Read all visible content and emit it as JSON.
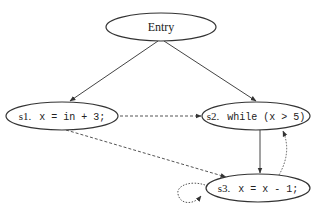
{
  "diagram": {
    "type": "control-flow / dependence graph",
    "nodes": [
      {
        "id": "entry",
        "label": "Entry",
        "cx": 161,
        "cy": 27,
        "rx": 55,
        "ry": 14
      },
      {
        "id": "s1",
        "prefix": "s1.",
        "code": "x = in + 3;",
        "cx": 62,
        "cy": 116,
        "rx": 56,
        "ry": 14
      },
      {
        "id": "s2",
        "prefix": "s2.",
        "code": "while (x > 5)",
        "cx": 256,
        "cy": 116,
        "rx": 54,
        "ry": 14
      },
      {
        "id": "s3",
        "prefix": "s3.",
        "code": "x = x - 1;",
        "cx": 258,
        "cy": 188,
        "rx": 52,
        "ry": 14
      }
    ],
    "edges": [
      {
        "from": "entry",
        "to": "s1",
        "style": "solid"
      },
      {
        "from": "entry",
        "to": "s2",
        "style": "solid"
      },
      {
        "from": "s1",
        "to": "s2",
        "style": "dashed"
      },
      {
        "from": "s1",
        "to": "s3",
        "style": "dashed"
      },
      {
        "from": "s2",
        "to": "s3",
        "style": "solid"
      },
      {
        "from": "s3",
        "to": "s2",
        "style": "dotted"
      },
      {
        "from": "s3",
        "to": "s3",
        "style": "dotted"
      }
    ]
  },
  "labels": {
    "entry": "Entry",
    "s1_prefix": "s1.",
    "s1_code": "x = in + 3;",
    "s2_prefix": "s2.",
    "s2_code": "while (x > 5)",
    "s3_prefix": "s3.",
    "s3_code": "x = x - 1;"
  },
  "colors": {
    "stroke": "#333333",
    "text": "#222222",
    "background": "#ffffff"
  }
}
